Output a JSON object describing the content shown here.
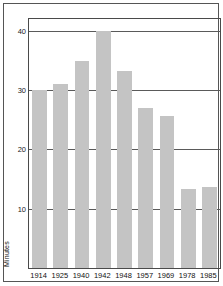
{
  "chart_data": {
    "type": "bar",
    "title": "",
    "xlabel": "",
    "ylabel": "Minutes",
    "categories": [
      "1914",
      "1925",
      "1940",
      "1942",
      "1948",
      "1957",
      "1969",
      "1978",
      "1985"
    ],
    "values": [
      30,
      31,
      35,
      40,
      33.3,
      27,
      25.7,
      13.3,
      13.7
    ],
    "ylim": [
      0,
      42
    ],
    "yticks": [
      10,
      20,
      30,
      40
    ],
    "ytick_labels": [
      "10",
      "20",
      "30",
      "40"
    ],
    "grid": true,
    "legend": "none",
    "bar_color": "#c4c4c4",
    "axis_color": "#4a4a4a",
    "grid_color": "#5a5a5a",
    "frame_color": "#555555",
    "background": "#ffffff"
  }
}
